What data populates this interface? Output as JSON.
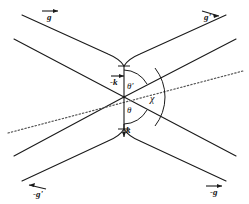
{
  "figure": {
    "background_color": "#ffffff",
    "line_color": "#1a1a1a",
    "dotted_line_color": "#555555",
    "width": 249,
    "height": 204
  },
  "labels": {
    "g_top_left": "g",
    "g_prime_top_right": "g'",
    "minus_g_prime_bottom_left": "-g'",
    "minus_g_bottom_right": "-g",
    "minus_k_center_top": "-k",
    "k_center_bottom": "k",
    "theta_prime": "θ'",
    "theta": "θ",
    "chi": "χ"
  },
  "vectors": [
    {
      "name": "g",
      "label": "g",
      "position": "top-left",
      "arrow_direction": "right"
    },
    {
      "name": "g-prime",
      "label": "g'",
      "position": "top-right",
      "arrow_direction": "right"
    },
    {
      "name": "minus-g-prime",
      "label": "-g'",
      "position": "bottom-left",
      "arrow_direction": "left"
    },
    {
      "name": "minus-g",
      "label": "-g",
      "position": "bottom-right",
      "arrow_direction": "right"
    },
    {
      "name": "minus-k",
      "label": "-k",
      "position": "center-upper",
      "arrow_direction": "up"
    },
    {
      "name": "k",
      "label": "k",
      "position": "center-lower",
      "arrow_direction": "down"
    }
  ],
  "angles": [
    {
      "name": "theta-prime",
      "label": "θ'",
      "position": "above-origin-right"
    },
    {
      "name": "theta",
      "label": "θ",
      "position": "below-origin-right"
    },
    {
      "name": "chi",
      "label": "χ",
      "position": "right-of-origin"
    }
  ]
}
